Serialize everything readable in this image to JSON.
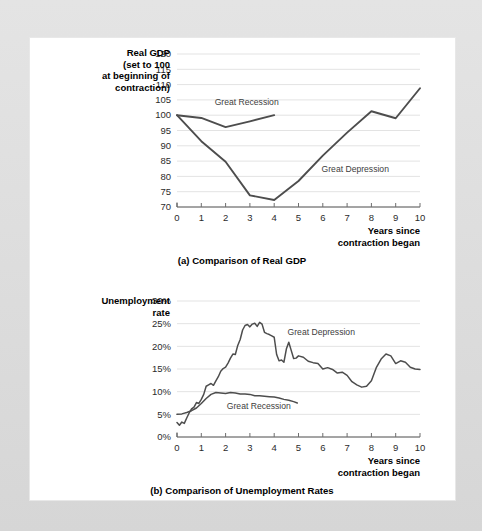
{
  "figure": {
    "panels": [
      {
        "id": "panel-a",
        "caption": "(a) Comparison of Real GDP",
        "y_axis_title_lines": [
          "Real GDP",
          "(set to 100",
          "at beginning of",
          "contraction)"
        ],
        "x_axis_title_lines": [
          "Years since",
          "contraction began"
        ]
      },
      {
        "id": "panel-b",
        "caption": "(b) Comparison of Unemployment Rates",
        "y_axis_title_lines": [
          "Unemployment",
          "rate"
        ],
        "x_axis_title_lines": [
          "Years since",
          "contraction began"
        ]
      }
    ]
  },
  "chart_data": [
    {
      "type": "line",
      "id": "real-gdp",
      "title": "(a) Comparison of Real GDP",
      "xlabel": "Years since contraction began",
      "ylabel": "Real GDP (set to 100 at beginning of contraction)",
      "xlim": [
        0,
        10
      ],
      "ylim": [
        70,
        120
      ],
      "xticks": [
        0,
        1,
        2,
        3,
        4,
        5,
        6,
        7,
        8,
        9,
        10
      ],
      "xtick_labels": [
        "0",
        "1",
        "2",
        "3",
        "4",
        "5",
        "6",
        "7",
        "8",
        "9",
        "10"
      ],
      "yticks": [
        70,
        75,
        80,
        85,
        90,
        95,
        100,
        105,
        110,
        115,
        120
      ],
      "ytick_labels": [
        "70",
        "75",
        "80",
        "85",
        "90",
        "95",
        "100",
        "105",
        "110",
        "115",
        "120"
      ],
      "grid": true,
      "legend": "inline-annotations",
      "series": [
        {
          "name": "Great Recession",
          "label_position": {
            "x": 1.55,
            "y": 103.2
          },
          "x": [
            0,
            1,
            2,
            3,
            4
          ],
          "values": [
            100.0,
            99.1,
            96.1,
            98.0,
            100.0
          ]
        },
        {
          "name": "Great Depression",
          "label_position": {
            "x": 5.95,
            "y": 81.5
          },
          "x": [
            0,
            1,
            2,
            3,
            4,
            5,
            6,
            7,
            8,
            9,
            10
          ],
          "values": [
            100.0,
            91.5,
            84.8,
            73.8,
            72.3,
            78.5,
            86.8,
            94.3,
            101.3,
            99.0,
            108.8
          ]
        }
      ]
    },
    {
      "type": "line",
      "id": "unemployment-rate",
      "title": "(b) Comparison of Unemployment Rates",
      "xlabel": "Years since contraction began",
      "ylabel": "Unemployment rate",
      "xlim": [
        0,
        10
      ],
      "ylim": [
        0,
        30
      ],
      "xticks": [
        0,
        1,
        2,
        3,
        4,
        5,
        6,
        7,
        8,
        9,
        10
      ],
      "xtick_labels": [
        "0",
        "1",
        "2",
        "3",
        "4",
        "5",
        "6",
        "7",
        "8",
        "9",
        "10"
      ],
      "yticks": [
        0,
        5,
        10,
        15,
        20,
        25,
        30
      ],
      "ytick_labels": [
        "0%",
        "5%",
        "10%",
        "15%",
        "20%",
        "25%",
        "30%"
      ],
      "grid": true,
      "legend": "inline-annotations",
      "series": [
        {
          "name": "Great Depression",
          "unit": "%",
          "label_position": {
            "x": 4.55,
            "y": 22.6
          },
          "x": [
            0,
            0.1,
            0.2,
            0.3,
            0.4,
            0.5,
            0.6,
            0.7,
            0.8,
            0.9,
            1.0,
            1.1,
            1.2,
            1.3,
            1.4,
            1.5,
            1.6,
            1.7,
            1.8,
            1.9,
            2.0,
            2.1,
            2.2,
            2.3,
            2.4,
            2.5,
            2.6,
            2.7,
            2.8,
            2.9,
            3.0,
            3.1,
            3.2,
            3.3,
            3.4,
            3.5,
            3.6,
            3.7,
            3.8,
            3.9,
            4.0,
            4.1,
            4.2,
            4.3,
            4.4,
            4.5,
            4.6,
            4.7,
            4.8,
            4.9,
            5.0,
            5.2,
            5.4,
            5.6,
            5.8,
            6.0,
            6.2,
            6.4,
            6.6,
            6.8,
            7.0,
            7.2,
            7.4,
            7.6,
            7.8,
            8.0,
            8.2,
            8.4,
            8.6,
            8.8,
            9.0,
            9.2,
            9.4,
            9.6,
            9.8,
            10.0
          ],
          "values": [
            3.2,
            2.6,
            3.3,
            3.0,
            4.2,
            5.3,
            6.2,
            6.6,
            7.6,
            7.4,
            8.3,
            9.4,
            11.2,
            11.5,
            11.8,
            11.4,
            12.4,
            13.3,
            14.5,
            15.1,
            15.4,
            16.3,
            17.4,
            18.3,
            18.2,
            20.2,
            21.5,
            23.6,
            24.6,
            24.8,
            24.3,
            24.9,
            25.1,
            24.4,
            25.3,
            24.9,
            23.1,
            22.8,
            22.6,
            22.3,
            22.0,
            18.2,
            16.8,
            17.0,
            16.5,
            19.4,
            20.9,
            19.1,
            17.3,
            17.4,
            17.9,
            17.6,
            16.7,
            16.4,
            16.2,
            15.0,
            15.3,
            14.9,
            14.1,
            14.3,
            13.6,
            12.2,
            11.5,
            11.0,
            11.2,
            12.4,
            15.3,
            17.2,
            18.3,
            17.9,
            16.2,
            16.8,
            16.5,
            15.4,
            15.0,
            14.9
          ]
        },
        {
          "name": "Great Recession",
          "unit": "%",
          "label_position": {
            "x": 2.05,
            "y": 6.2
          },
          "x": [
            0,
            0.2,
            0.4,
            0.6,
            0.8,
            1.0,
            1.2,
            1.4,
            1.6,
            1.8,
            2.0,
            2.2,
            2.4,
            2.6,
            2.8,
            3.0,
            3.2,
            3.4,
            3.6,
            3.8,
            4.0,
            4.2,
            4.4,
            4.6,
            4.8,
            4.95
          ],
          "values": [
            5.0,
            5.1,
            5.4,
            5.8,
            6.4,
            7.4,
            8.5,
            9.4,
            9.8,
            9.7,
            9.6,
            9.8,
            9.7,
            9.5,
            9.5,
            9.4,
            9.1,
            9.1,
            9.0,
            8.9,
            8.8,
            8.6,
            8.3,
            8.1,
            7.8,
            7.5
          ]
        }
      ]
    }
  ]
}
